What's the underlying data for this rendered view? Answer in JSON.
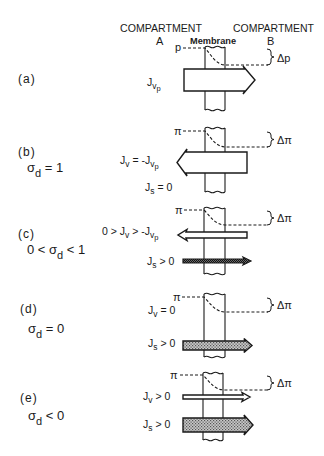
{
  "header": {
    "compartment_a_title": "COMPARTMENT",
    "compartment_a_letter": "A",
    "compartment_b_title": "COMPARTMENT",
    "compartment_b_letter": "B",
    "membrane_label": "Membrane"
  },
  "panels": [
    {
      "label": "(a)",
      "condition": [],
      "gradient": {
        "symbol": "p",
        "delta": "Δp"
      },
      "flows": [
        {
          "text": [
            "J",
            "v",
            "p"
          ],
          "direction": "right",
          "style": "open-wide"
        }
      ]
    },
    {
      "label": "(b)",
      "condition": [
        "σ",
        "d",
        " = 1"
      ],
      "gradient": {
        "symbol": "π",
        "delta": "Δπ"
      },
      "flows": [
        {
          "text": [
            "J",
            "v",
            " = -J",
            "v",
            "p"
          ],
          "direction": "left",
          "style": "open-wide"
        },
        {
          "text": [
            "J",
            "s",
            " = 0"
          ],
          "direction": "none",
          "style": "none"
        }
      ]
    },
    {
      "label": "(c)",
      "condition": [
        "0 < σ",
        "d",
        " < 1"
      ],
      "gradient": {
        "symbol": "π",
        "delta": "Δπ"
      },
      "flows": [
        {
          "text": [
            "0 > J",
            "v",
            " > -J",
            "v",
            "p"
          ],
          "direction": "left",
          "style": "open-thin"
        },
        {
          "text": [
            "J",
            "s",
            " > 0"
          ],
          "direction": "right",
          "style": "hatched-thin"
        }
      ]
    },
    {
      "label": "(d)",
      "condition": [
        "σ",
        "d",
        " = 0"
      ],
      "gradient": {
        "symbol": "π",
        "delta": "Δπ"
      },
      "flows": [
        {
          "text": [
            "J",
            "v",
            " = 0"
          ],
          "direction": "none",
          "style": "none"
        },
        {
          "text": [
            "J",
            "s",
            " > 0"
          ],
          "direction": "right",
          "style": "hatched-medium"
        }
      ]
    },
    {
      "label": "(e)",
      "condition": [
        "σ",
        "d",
        " < 0"
      ],
      "gradient": {
        "symbol": "π",
        "delta": "Δπ"
      },
      "flows": [
        {
          "text": [
            "J",
            "v",
            " > 0"
          ],
          "direction": "right",
          "style": "open-thin"
        },
        {
          "text": [
            "J",
            "s",
            " > 0"
          ],
          "direction": "right",
          "style": "hatched-wide"
        }
      ]
    }
  ],
  "colors": {
    "ink": "#1a1a1a",
    "background": "#ffffff",
    "stipple": "#9a9a9a",
    "stipple_dark": "#4a4a4a"
  }
}
